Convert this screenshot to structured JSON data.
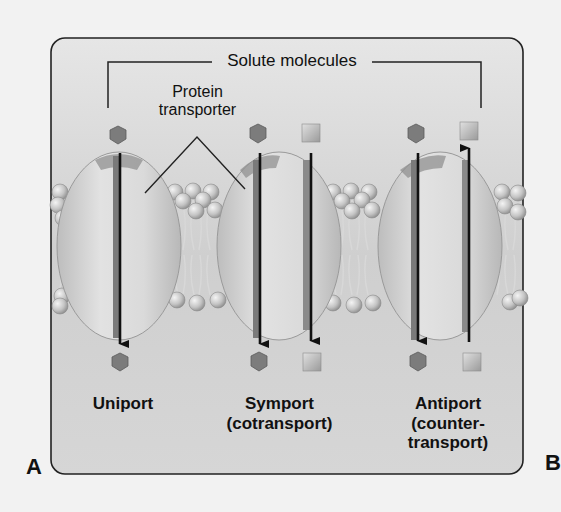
{
  "figure": {
    "panel_left": "A",
    "panel_right": "B",
    "bracket_label": "Solute molecules",
    "protein_label_line1": "Protein",
    "protein_label_line2": "transporter",
    "colors": {
      "frame_fill": "#cfcfcf",
      "frame_stroke": "#222222",
      "protein_fill": "#d9d9d9",
      "protein_channel": "#7a7a7a",
      "hexagon_solute": "#7c7c7c",
      "square_solute": "#bdbdbd",
      "lipid_head": "#c8c8c8",
      "arrow": "#111111"
    }
  },
  "transporters": [
    {
      "id": "uniport",
      "label_line1": "Uniport",
      "label_line2": "",
      "label_line3": "",
      "solutes": [
        {
          "shape": "hexagon",
          "direction": "down"
        }
      ]
    },
    {
      "id": "symport",
      "label_line1": "Symport",
      "label_line2": "(cotransport)",
      "label_line3": "",
      "solutes": [
        {
          "shape": "hexagon",
          "direction": "down"
        },
        {
          "shape": "square",
          "direction": "down"
        }
      ]
    },
    {
      "id": "antiport",
      "label_line1": "Antiport",
      "label_line2": "(counter-",
      "label_line3": "transport)",
      "solutes": [
        {
          "shape": "hexagon",
          "direction": "down"
        },
        {
          "shape": "square",
          "direction": "up"
        }
      ]
    }
  ]
}
